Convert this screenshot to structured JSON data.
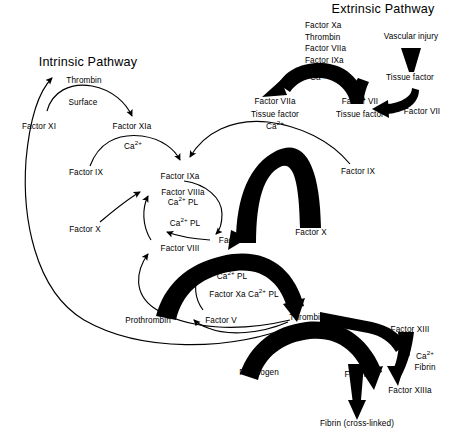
{
  "diagram": {
    "type": "coagulation-cascade",
    "titles": {
      "intrinsic": "Intrinsic Pathway",
      "extrinsic": "Extrinsic Pathway"
    },
    "nodes": {
      "thrombin_top": "Thrombin",
      "surface": "Surface",
      "factor_xi": "Factor XI",
      "factor_xia": "Factor XIa",
      "ca_1": "Ca",
      "factor_ix_left": "Factor IX",
      "factor_ixa": "Factor IXa",
      "factor_viiia": "Factor VIIIa",
      "ca_pl_1": "Ca",
      "factor_x_left": "Factor X",
      "ca_pl_2": "Ca",
      "factor_viii": "Factor VIII",
      "factor_xa": "Factor Xa",
      "factor_ix_right": "Factor IX",
      "factor_x_right": "Factor X",
      "activators_xa": "Factor Xa",
      "activators_thrombin": "Thrombin",
      "activators_viia": "Factor VIIa",
      "activators_ixa": "Factor IXa",
      "ca_2": "Ca",
      "vascular_injury": "Vascular injury",
      "tissue_factor_1": "Tissue factor",
      "factor_vii_right": "Factor VII",
      "factor_vii_mid": "Factor VII",
      "tissue_factor_2": "Tissue factor",
      "factor_viia": "Factor VIIa",
      "tissue_factor_3": "Tissue factor",
      "ca_3": "Ca",
      "factor_va": "Factor Va",
      "ca_pl_3": "Ca",
      "factor_xa_ca_pl": "Factor Xa  Ca",
      "ca_pl_4_suffix": "PL",
      "factor_v": "Factor V",
      "prothrombin": "Prothrombin",
      "thrombin_bottom": "Thrombin",
      "fibrinogen": "Fibrinogen",
      "fibrin": "Fibrin",
      "factor_xiii": "Factor XIII",
      "ca_4": "Ca",
      "fibrin_cofactor": "Fibrin",
      "factor_xiiia": "Factor XIIIa",
      "fibrin_crosslinked": "Fibrin (cross-linked)"
    },
    "superscript": "2+",
    "pl": "PL",
    "colors": {
      "ink": "#000000",
      "background": "#ffffff"
    }
  }
}
